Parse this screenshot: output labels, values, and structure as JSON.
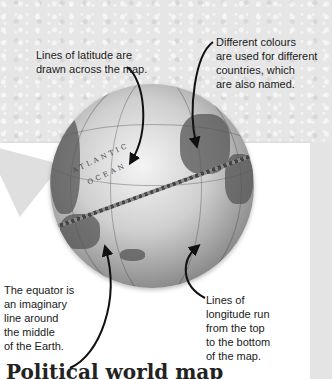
{
  "annotations": {
    "latitude": "Lines of latitude are drawn across the map.",
    "latitude_lines": [
      "Lines of latitude are",
      "drawn across the map."
    ],
    "colours": "Different colours are used for different countries, which are also named.",
    "colours_lines": [
      "Different colours",
      "are used for different",
      "countries, which",
      "are also named."
    ],
    "equator": "The equator is an imaginary line around the middle of the Earth.",
    "equator_lines": [
      "The equator is",
      "an imaginary",
      "line around",
      "the middle",
      "of the Earth."
    ],
    "longitude": "Lines of longitude run from the top to the bottom of the map.",
    "longitude_lines": [
      "Lines of",
      "longitude run",
      "from the top",
      "to the bottom",
      "of the map."
    ]
  },
  "globe": {
    "ocean_label_1": "ATLANTIC",
    "ocean_label_2": "OCEAN"
  },
  "title": "Political world map",
  "colors": {
    "background": "#e6e6e6",
    "card": "#ffffff",
    "text": "#1a1a1a",
    "arrow": "#111111"
  }
}
